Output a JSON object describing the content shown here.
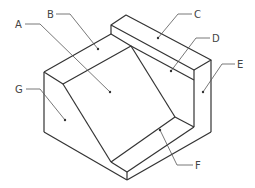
{
  "diagram": {
    "type": "isometric-part-drawing",
    "labels": [
      {
        "id": "A",
        "text": "A"
      },
      {
        "id": "B",
        "text": "B"
      },
      {
        "id": "C",
        "text": "C"
      },
      {
        "id": "D",
        "text": "D"
      },
      {
        "id": "E",
        "text": "E"
      },
      {
        "id": "F",
        "text": "F"
      },
      {
        "id": "G",
        "text": "G"
      }
    ]
  }
}
